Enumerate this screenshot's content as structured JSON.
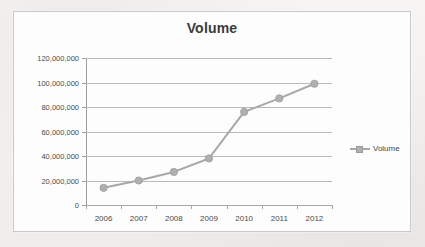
{
  "chart_data": {
    "type": "line",
    "title": "Volume",
    "xlabel": "",
    "ylabel": "",
    "categories": [
      "2006",
      "2007",
      "2008",
      "2009",
      "2010",
      "2011",
      "2012"
    ],
    "series": [
      {
        "name": "Volume",
        "values": [
          14000000,
          20000000,
          27000000,
          38000000,
          76000000,
          87000000,
          99000000
        ]
      }
    ],
    "ylim": [
      0,
      120000000
    ],
    "yticks": [
      0,
      20000000,
      40000000,
      60000000,
      80000000,
      100000000,
      120000000
    ],
    "ytick_labels": [
      "0",
      "20,000,000",
      "40,000,000",
      "60,000,000",
      "80,000,000",
      "100,000,000",
      "120,000,000"
    ],
    "grid": true,
    "legend": {
      "position": "right",
      "entries": [
        "Volume"
      ]
    },
    "colors": {
      "series": "#a8a8a8",
      "marker": "#b0b0b0",
      "gridline": "#b9b9b9",
      "axis": "#9e9e9e",
      "title_text": "#3b3b3b",
      "tick_text": "#4a4a4a",
      "plot_background": "#fdfdfd",
      "frame_border": "#c9c9c9",
      "page_background": "#f3f2f0"
    }
  }
}
